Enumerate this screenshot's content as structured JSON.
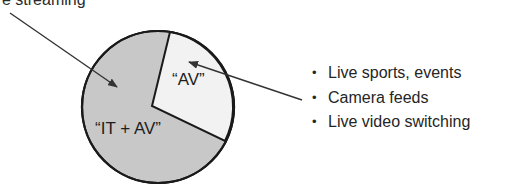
{
  "title_partial": "e streaming",
  "pie": {
    "slices": [
      {
        "label": "“IT + AV”",
        "fill": "#c8c8c8"
      },
      {
        "label": "“AV”",
        "fill": "#f2f2f2"
      }
    ],
    "outline_color": "#1a1a1a"
  },
  "bullets": [
    {
      "text": "Live sports, events"
    },
    {
      "text": "Camera feeds"
    },
    {
      "text": "Live video switching"
    }
  ],
  "bullet_glyph": "•"
}
